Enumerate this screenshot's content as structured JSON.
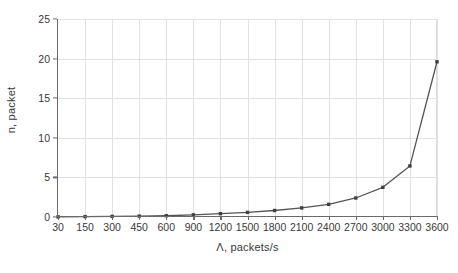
{
  "chart_data": {
    "type": "line",
    "title": "",
    "subtitle": "",
    "xlabel": "Λ, packets/s",
    "ylabel": "n, packet",
    "categories": [
      "30",
      "150",
      "300",
      "450",
      "600",
      "900",
      "1200",
      "1500",
      "1800",
      "2100",
      "2400",
      "2700",
      "3000",
      "3300",
      "3600"
    ],
    "x": [
      30,
      150,
      300,
      450,
      600,
      900,
      1200,
      1500,
      1800,
      2100,
      2400,
      2700,
      3000,
      3300,
      3600
    ],
    "values": [
      0.02,
      0.05,
      0.08,
      0.11,
      0.16,
      0.27,
      0.42,
      0.58,
      0.82,
      1.15,
      1.6,
      2.4,
      3.75,
      6.45,
      19.6
    ],
    "series": [
      {
        "name": "n",
        "values": [
          0.02,
          0.05,
          0.08,
          0.11,
          0.16,
          0.27,
          0.42,
          0.58,
          0.82,
          1.15,
          1.6,
          2.4,
          3.75,
          6.45,
          19.6
        ]
      }
    ],
    "ylim": [
      0,
      25
    ],
    "yticks": [
      0,
      5,
      10,
      15,
      20,
      25
    ],
    "ytick_labels": [
      "0",
      "5",
      "10",
      "15",
      "20",
      "25"
    ],
    "xlim_index": [
      0,
      14
    ],
    "grid": true,
    "grid_color": "#e2e2e4",
    "legend": "none",
    "line_color": "#555555",
    "marker": "square",
    "marker_color": "#3f3f3f",
    "background": "#ffffff",
    "axis_color": "#6a6a6a",
    "text_color": "#3a3a3a"
  }
}
